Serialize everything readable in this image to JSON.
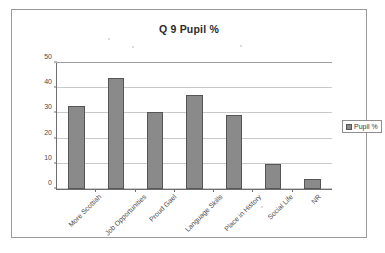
{
  "chart_data": {
    "type": "bar",
    "title": "Q 9 Pupil %",
    "xlabel": "",
    "ylabel": "",
    "ylim": [
      0,
      50
    ],
    "ytick_step": 10,
    "yticks": [
      50,
      40,
      30,
      20,
      10,
      0
    ],
    "grid": true,
    "legend_position": "right",
    "categories": [
      "More Scottish",
      "Job Opportunities",
      "Proud Gael",
      "Language Skills",
      "Place in History",
      "Social Life",
      "NR"
    ],
    "series": [
      {
        "name": "Pupil %",
        "color": "#8a8a8a",
        "values": [
          33,
          44,
          30.5,
          37.5,
          29.5,
          10,
          4
        ]
      }
    ]
  },
  "legend": {
    "entries": [
      {
        "label": "Pupil %"
      }
    ]
  }
}
